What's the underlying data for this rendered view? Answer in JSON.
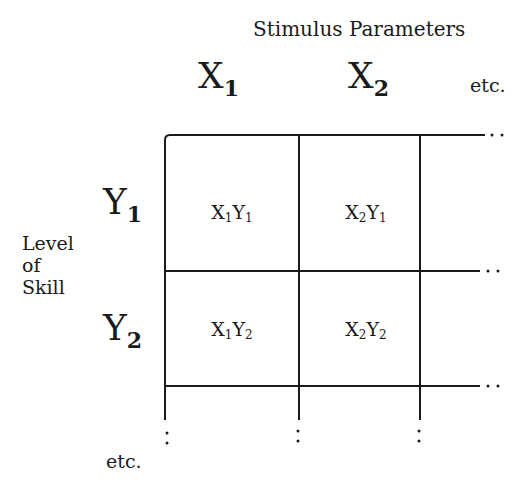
{
  "diagram": {
    "title": "Stimulus Parameters",
    "columns": [
      {
        "base": "X",
        "sub": "1"
      },
      {
        "base": "X",
        "sub": "2"
      }
    ],
    "columns_etc": "etc.",
    "row_axis_label": [
      "Level",
      "of",
      "Skill"
    ],
    "rows": [
      {
        "base": "Y",
        "sub": "1"
      },
      {
        "base": "Y",
        "sub": "2"
      }
    ],
    "rows_etc": "etc.",
    "cells": [
      [
        {
          "a": "X",
          "as": "1",
          "b": "Y",
          "bs": "1"
        },
        {
          "a": "X",
          "as": "2",
          "b": "Y",
          "bs": "1"
        }
      ],
      [
        {
          "a": "X",
          "as": "1",
          "b": "Y",
          "bs": "2"
        },
        {
          "a": "X",
          "as": "2",
          "b": "Y",
          "bs": "2"
        }
      ]
    ]
  }
}
